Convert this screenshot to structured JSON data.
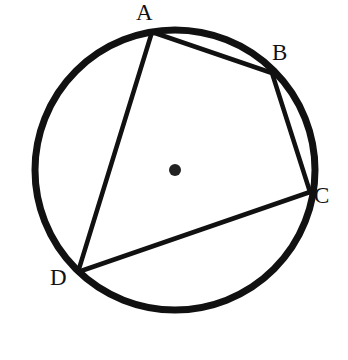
{
  "figure": {
    "background_color": "#ffffff",
    "ink_color": "#111111",
    "circle": {
      "name": "circumscribed-circle",
      "center_x": 175,
      "center_y": 170,
      "radius": 140,
      "stroke_width": 7,
      "stroke_color": "#111111",
      "fill": "none"
    },
    "center_dot": {
      "name": "circle-center-point",
      "x": 175,
      "y": 170,
      "radius": 6,
      "fill_color": "#222222"
    },
    "vertices": [
      {
        "label": "A",
        "x": 152,
        "y": 32,
        "label_x": 136,
        "label_y": 1
      },
      {
        "label": "B",
        "x": 272,
        "y": 73,
        "label_x": 272,
        "label_y": 41
      },
      {
        "label": "C",
        "x": 310,
        "y": 192,
        "label_x": 314,
        "label_y": 184
      },
      {
        "label": "D",
        "x": 78,
        "y": 272,
        "label_x": 50,
        "label_y": 266
      }
    ],
    "chords": [
      {
        "name": "chord-AB",
        "from": "A",
        "to": "B",
        "x1": 152,
        "y1": 32,
        "x2": 272,
        "y2": 73
      },
      {
        "name": "chord-BC",
        "from": "B",
        "to": "C",
        "x1": 272,
        "y1": 73,
        "x2": 310,
        "y2": 192
      },
      {
        "name": "chord-CD",
        "from": "C",
        "to": "D",
        "x1": 310,
        "y1": 192,
        "x2": 78,
        "y2": 272
      },
      {
        "name": "chord-DA",
        "from": "D",
        "to": "A",
        "x1": 78,
        "y1": 272,
        "x2": 152,
        "y2": 32
      }
    ],
    "chord_stroke_width": 4.5,
    "chord_stroke_color": "#111111",
    "labels": {
      "a": "A",
      "b": "B",
      "c": "C",
      "d": "D"
    }
  }
}
